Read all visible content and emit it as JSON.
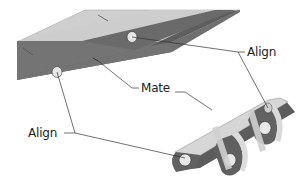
{
  "diagram": {
    "type": "cad-assembly-constraints",
    "labels": {
      "align_top": "Align",
      "mate": "Mate",
      "align_left": "Align"
    },
    "colors": {
      "bar_top": "#c9c9c9",
      "bar_side": "#6e6e6e",
      "bracket_face": "#5a5a5a",
      "bracket_edge": "#d8d8d8",
      "leader": "#333333",
      "text": "#222222"
    }
  }
}
